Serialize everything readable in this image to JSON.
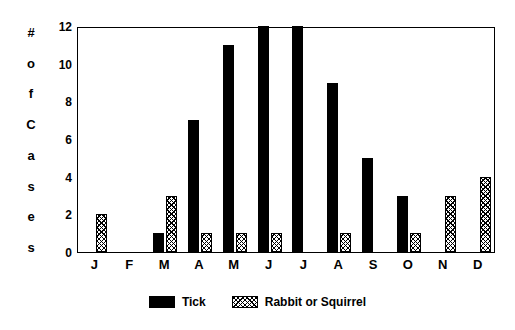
{
  "chart_data": {
    "type": "bar",
    "title": "",
    "subtitle": "",
    "xlabel": "",
    "ylabel": "# of Cases",
    "ylabel_chars": [
      "#",
      "o",
      "f",
      "C",
      "a",
      "s",
      "e",
      "s"
    ],
    "categories": [
      "J",
      "F",
      "M",
      "A",
      "M",
      "J",
      "J",
      "A",
      "S",
      "O",
      "N",
      "D"
    ],
    "yticks": [
      0,
      2,
      4,
      6,
      8,
      10,
      12
    ],
    "ylim": [
      0,
      12
    ],
    "grid": false,
    "legend_position": "bottom-center",
    "series": [
      {
        "name": "Tick",
        "color": "#000000",
        "fill": "solid",
        "values": [
          0,
          0,
          1,
          7,
          11,
          12,
          12,
          9,
          5,
          3,
          0,
          0
        ]
      },
      {
        "name": "Rabbit or Squirrel",
        "color": "#000000",
        "fill": "hatched",
        "values": [
          2,
          0,
          3,
          1,
          1,
          1,
          0,
          1,
          0,
          1,
          3,
          4
        ]
      }
    ]
  },
  "legend": {
    "items": [
      {
        "label": "Tick",
        "swatch": "solid-black-swatch"
      },
      {
        "label": "Rabbit or Squirrel",
        "swatch": "hatched-swatch"
      }
    ]
  }
}
